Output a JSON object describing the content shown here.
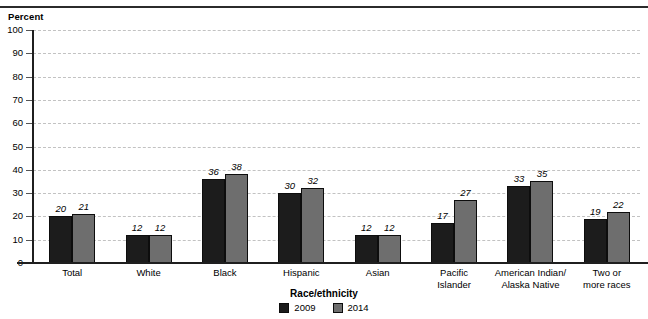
{
  "top_caption_fragment": "",
  "chart_data": {
    "type": "bar",
    "title": "",
    "xlabel": "Race/ethnicity",
    "ylabel": "Percent",
    "ylim": [
      0,
      100
    ],
    "ytick_step": 10,
    "yticks": [
      "100",
      "90",
      "80",
      "70",
      "60",
      "50",
      "40",
      "30",
      "20",
      "10",
      "0"
    ],
    "grid": true,
    "legend_position": "bottom-center",
    "categories": [
      "Total",
      "White",
      "Black",
      "Hispanic",
      "Asian",
      "Pacific\nIslander",
      "American Indian/\nAlaska Native",
      "Two or\nmore races"
    ],
    "series": [
      {
        "name": "2009",
        "color": "#1c1c1c",
        "values": [
          20,
          12,
          36,
          30,
          12,
          17,
          33,
          19
        ]
      },
      {
        "name": "2014",
        "color": "#6e6e6e",
        "values": [
          21,
          12,
          38,
          32,
          12,
          27,
          35,
          22
        ]
      }
    ]
  },
  "axis": {
    "y_title": "Percent",
    "x_title": "Race/ethnicity"
  },
  "legend": {
    "items": [
      {
        "label": "2009",
        "color": "#1c1c1c"
      },
      {
        "label": "2014",
        "color": "#6e6e6e"
      }
    ]
  }
}
